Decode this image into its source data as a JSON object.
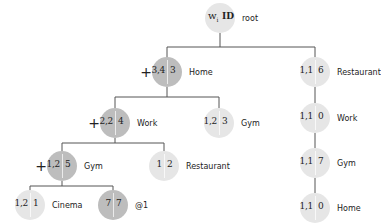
{
  "colors": {
    "light": "#e6e6e6",
    "medium": "#d2d2d2",
    "dark": "#bdbdbd",
    "edge": "#555555"
  },
  "root": {
    "w_label": "w",
    "w_subscript": "i",
    "id_label": "ID",
    "name": "root"
  },
  "nodes": [
    {
      "key": "home",
      "w": "3,4",
      "id": "3",
      "name": "Home",
      "plus": "+",
      "shade": "dark"
    },
    {
      "key": "work",
      "w": "2,2",
      "id": "4",
      "name": "Work",
      "plus": "+",
      "shade": "dark"
    },
    {
      "key": "gym-mid",
      "w": "1,2",
      "id": "3",
      "name": "Gym",
      "plus": "",
      "shade": "light"
    },
    {
      "key": "gym-l3",
      "w": "1,2",
      "id": "5",
      "name": "Gym",
      "plus": "+",
      "shade": "dark"
    },
    {
      "key": "restaurant-l3",
      "w": "1",
      "id": "2",
      "name": "Restaurant",
      "plus": "",
      "shade": "light"
    },
    {
      "key": "cinema",
      "w": "1,2",
      "id": "1",
      "name": "Cinema",
      "plus": "",
      "shade": "light"
    },
    {
      "key": "at1",
      "w": "7",
      "id": "7",
      "name": "@1",
      "plus": "",
      "shade": "dark"
    },
    {
      "key": "restaurant-r",
      "w": "1,1",
      "id": "6",
      "name": "Restaurant",
      "plus": "",
      "shade": "light"
    },
    {
      "key": "work-r",
      "w": "1,1",
      "id": "0",
      "name": "Work",
      "plus": "",
      "shade": "light"
    },
    {
      "key": "gym-r",
      "w": "1,1",
      "id": "7",
      "name": "Gym",
      "plus": "",
      "shade": "light"
    },
    {
      "key": "home-r",
      "w": "1,1",
      "id": "0",
      "name": "Home",
      "plus": "",
      "shade": "light"
    }
  ]
}
